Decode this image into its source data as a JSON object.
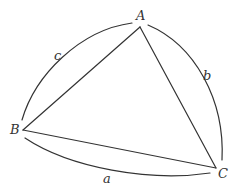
{
  "diagram": {
    "type": "spherical-triangle",
    "vertices": [
      {
        "id": "A",
        "label": "A",
        "x": 140,
        "y": 27
      },
      {
        "id": "B",
        "label": "B",
        "x": 23,
        "y": 130
      },
      {
        "id": "C",
        "label": "C",
        "x": 216,
        "y": 168
      }
    ],
    "sides": [
      {
        "id": "a",
        "label": "a",
        "between": [
          "B",
          "C"
        ]
      },
      {
        "id": "b",
        "label": "b",
        "between": [
          "A",
          "C"
        ]
      },
      {
        "id": "c",
        "label": "c",
        "between": [
          "A",
          "B"
        ]
      }
    ],
    "colors": {
      "stroke": "#333333",
      "background": "#ffffff"
    }
  }
}
